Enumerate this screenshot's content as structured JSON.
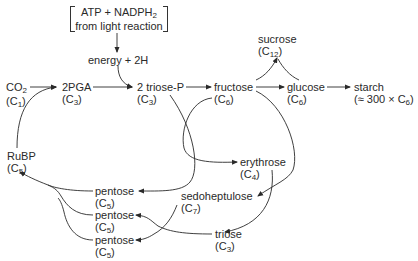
{
  "diagram": {
    "type": "calvin-cycle-flow",
    "input_box": {
      "line1_main": "ATP + NADPH",
      "line1_sub": "2",
      "line2": "from light reaction"
    },
    "energy": "energy + 2H",
    "nodes": {
      "co2": {
        "name": "CO",
        "name_sub": "2",
        "carbon": "C",
        "carbon_sub": "1"
      },
      "pga": {
        "name": "2PGA",
        "carbon": "C",
        "carbon_sub": "3"
      },
      "triose_p": {
        "name": "2 triose-P",
        "carbon": "C",
        "carbon_sub": "3"
      },
      "fructose": {
        "name": "fructose",
        "carbon": "C",
        "carbon_sub": "6"
      },
      "glucose": {
        "name": "glucose",
        "carbon": "C",
        "carbon_sub": "6"
      },
      "sucrose": {
        "name": "sucrose",
        "carbon": "C",
        "carbon_sub": "12"
      },
      "starch": {
        "name": "starch",
        "carbon_prefix": "≈ 300 × C",
        "carbon_sub": "6"
      },
      "rubp": {
        "name": "RuBP",
        "carbon": "C",
        "carbon_sub": "5"
      },
      "erythrose": {
        "name": "erythrose",
        "carbon": "C",
        "carbon_sub": "4"
      },
      "sedoheptulose": {
        "name": "sedoheptulose",
        "carbon": "C",
        "carbon_sub": "7"
      },
      "triose": {
        "name": "triose",
        "carbon": "C",
        "carbon_sub": "3"
      },
      "pentose1": {
        "name": "pentose",
        "carbon": "C",
        "carbon_sub": "5"
      },
      "pentose2": {
        "name": "pentose",
        "carbon": "C",
        "carbon_sub": "5"
      },
      "pentose3": {
        "name": "pentose",
        "carbon": "C",
        "carbon_sub": "5"
      }
    },
    "edges": [
      [
        "input_box",
        "energy"
      ],
      [
        "energy",
        "triose_p"
      ],
      [
        "co2",
        "pga"
      ],
      [
        "rubp",
        "pga"
      ],
      [
        "pga",
        "triose_p"
      ],
      [
        "triose_p",
        "fructose"
      ],
      [
        "fructose",
        "glucose"
      ],
      [
        "fructose",
        "sucrose"
      ],
      [
        "glucose",
        "sucrose"
      ],
      [
        "glucose",
        "starch"
      ],
      [
        "triose_p",
        "pentose1"
      ],
      [
        "fructose",
        "erythrose"
      ],
      [
        "fructose",
        "sedoheptulose"
      ],
      [
        "erythrose",
        "triose"
      ],
      [
        "sedoheptulose",
        "pentose3"
      ],
      [
        "triose",
        "pentose2"
      ],
      [
        "pentose1",
        "rubp"
      ],
      [
        "pentose2",
        "rubp"
      ],
      [
        "pentose3",
        "rubp"
      ]
    ],
    "colors": {
      "ink": "#2a2a2a",
      "background": "#ffffff"
    }
  }
}
